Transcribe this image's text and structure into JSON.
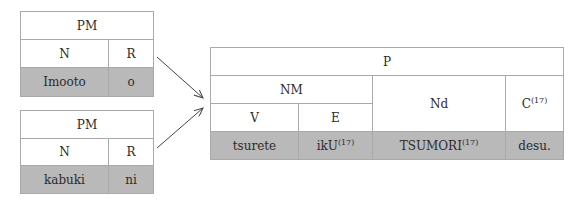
{
  "diagram": {
    "left_top": {
      "title": "PM",
      "headers": [
        "N",
        "R"
      ],
      "values": [
        "Imooto",
        "o"
      ]
    },
    "left_bottom": {
      "title": "PM",
      "headers": [
        "N",
        "R"
      ],
      "values": [
        "kabuki",
        "ni"
      ]
    },
    "right": {
      "title": "P",
      "nm": "NM",
      "nd": "Nd",
      "c": "C",
      "c_sup": "(17)",
      "v": "V",
      "e": "E",
      "values": {
        "v": "tsurete",
        "e": "ikU",
        "e_sup": "(17)",
        "nd": "TSUMORI",
        "nd_sup": "(17)",
        "c": "desu."
      }
    },
    "colors": {
      "border": "#a9a9a9",
      "shade": "#b9b9b9",
      "arrow": "#444444"
    }
  }
}
